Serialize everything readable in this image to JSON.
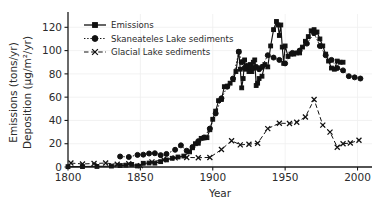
{
  "chart_data": {
    "type": "line",
    "title": "",
    "xlabel": "Year",
    "ylabel_line1": "Emissions (tons/yr)",
    "ylabel_line2": "Deposition (μg/m²/yr)",
    "xlim": [
      1800,
      2010
    ],
    "ylim": [
      0,
      128
    ],
    "xticks": [
      1800,
      1850,
      1900,
      1950,
      2000
    ],
    "yticks": [
      0,
      20,
      40,
      60,
      80,
      100,
      120
    ],
    "grid": true,
    "grid_axis": "y",
    "legend_position": "upper-left",
    "series": [
      {
        "name": "Emissions",
        "marker": "square",
        "linestyle": "solid",
        "color": "#111111",
        "points": [
          [
            1800,
            0.3
          ],
          [
            1810,
            0.4
          ],
          [
            1820,
            0.5
          ],
          [
            1830,
            0.8
          ],
          [
            1836,
            1.2
          ],
          [
            1840,
            1.6
          ],
          [
            1844,
            2.2
          ],
          [
            1848,
            0.9
          ],
          [
            1852,
            3.2
          ],
          [
            1856,
            3.4
          ],
          [
            1860,
            3.3
          ],
          [
            1864,
            4.6
          ],
          [
            1868,
            6.1
          ],
          [
            1872,
            7.5
          ],
          [
            1876,
            8.6
          ],
          [
            1880,
            9.4
          ],
          [
            1884,
            13.0
          ],
          [
            1886,
            16.5
          ],
          [
            1888,
            20.0
          ],
          [
            1890,
            20.4
          ],
          [
            1892,
            24.6
          ],
          [
            1894,
            25.0
          ],
          [
            1896,
            25.2
          ],
          [
            1898,
            32.0
          ],
          [
            1900,
            41.0
          ],
          [
            1902,
            48.0
          ],
          [
            1904,
            57.0
          ],
          [
            1906,
            58.0
          ],
          [
            1908,
            69.0
          ],
          [
            1910,
            69.5
          ],
          [
            1912,
            72.0
          ],
          [
            1914,
            75.0
          ],
          [
            1916,
            82.0
          ],
          [
            1918,
            99.0
          ],
          [
            1919,
            84.0
          ],
          [
            1920,
            68.0
          ],
          [
            1921,
            76.0
          ],
          [
            1922,
            92.0
          ],
          [
            1923,
            84.0
          ],
          [
            1924,
            86.0
          ],
          [
            1925,
            82.0
          ],
          [
            1926,
            88.0
          ],
          [
            1927,
            82.0
          ],
          [
            1928,
            90.0
          ],
          [
            1929,
            92.0
          ],
          [
            1930,
            70.0
          ],
          [
            1931,
            72.0
          ],
          [
            1932,
            76.0
          ],
          [
            1934,
            78.0
          ],
          [
            1936,
            88.0
          ],
          [
            1938,
            86.0
          ],
          [
            1940,
            104.0
          ],
          [
            1942,
            118.0
          ],
          [
            1944,
            125.0
          ],
          [
            1945,
            122.0
          ],
          [
            1946,
            113.0
          ],
          [
            1947,
            122.0
          ],
          [
            1948,
            103.0
          ],
          [
            1949,
            89.0
          ],
          [
            1950,
            104.0
          ],
          [
            1952,
            95.0
          ],
          [
            1954,
            97.0
          ],
          [
            1956,
            97.0
          ],
          [
            1958,
            98.0
          ],
          [
            1960,
            98.0
          ],
          [
            1962,
            103.0
          ],
          [
            1964,
            108.0
          ],
          [
            1966,
            112.0
          ],
          [
            1968,
            117.0
          ],
          [
            1970,
            118.0
          ],
          [
            1972,
            116.0
          ],
          [
            1974,
            110.0
          ],
          [
            1976,
            104.0
          ],
          [
            1978,
            97.0
          ],
          [
            1980,
            91.0
          ],
          [
            1982,
            85.0
          ],
          [
            1984,
            84.0
          ],
          [
            1986,
            91.0
          ],
          [
            1988,
            90.0
          ],
          [
            1990,
            90.0
          ]
        ]
      },
      {
        "name": "Skaneateles Lake sediments",
        "marker": "circle",
        "linestyle": "dotted",
        "color": "#111111",
        "points": [
          [
            1836,
            9.0
          ],
          [
            1842,
            8.6
          ],
          [
            1848,
            10.4
          ],
          [
            1852,
            10.6
          ],
          [
            1856,
            11.6
          ],
          [
            1860,
            11.8
          ],
          [
            1864,
            10.2
          ],
          [
            1868,
            11.2
          ],
          [
            1874,
            14.8
          ],
          [
            1878,
            18.6
          ],
          [
            1882,
            14.0
          ],
          [
            1886,
            17.2
          ],
          [
            1890,
            22.2
          ],
          [
            1894,
            25.4
          ],
          [
            1898,
            33.0
          ],
          [
            1902,
            46.0
          ],
          [
            1906,
            59.0
          ],
          [
            1910,
            69.0
          ],
          [
            1914,
            76.0
          ],
          [
            1918,
            99.0
          ],
          [
            1920,
            90.0
          ],
          [
            1922,
            85.0
          ],
          [
            1924,
            87.0
          ],
          [
            1926,
            86.0
          ],
          [
            1928,
            85.0
          ],
          [
            1930,
            86.0
          ],
          [
            1932,
            84.0
          ],
          [
            1934,
            86.0
          ],
          [
            1938,
            96.0
          ],
          [
            1942,
            94.0
          ],
          [
            1946,
            92.0
          ],
          [
            1950,
            89.0
          ],
          [
            1955,
            98.0
          ],
          [
            1960,
            100.0
          ],
          [
            1965,
            106.0
          ],
          [
            1970,
            115.0
          ],
          [
            1974,
            104.0
          ],
          [
            1978,
            96.0
          ],
          [
            1982,
            92.0
          ],
          [
            1986,
            85.0
          ],
          [
            1990,
            83.0
          ],
          [
            1994,
            78.0
          ],
          [
            1998,
            77.0
          ],
          [
            2002,
            76.0
          ]
        ]
      },
      {
        "name": "Glacial Lake sediments",
        "marker": "x",
        "linestyle": "dashed",
        "color": "#111111",
        "points": [
          [
            1802,
            3.4
          ],
          [
            1810,
            2.6
          ],
          [
            1818,
            3.0
          ],
          [
            1826,
            3.4
          ],
          [
            1834,
            2.4
          ],
          [
            1842,
            2.8
          ],
          [
            1850,
            1.2
          ],
          [
            1858,
            4.4
          ],
          [
            1866,
            6.4
          ],
          [
            1874,
            7.8
          ],
          [
            1882,
            8.2
          ],
          [
            1890,
            8.0
          ],
          [
            1898,
            8.2
          ],
          [
            1906,
            15.0
          ],
          [
            1913,
            22.6
          ],
          [
            1919,
            19.0
          ],
          [
            1925,
            19.6
          ],
          [
            1931,
            20.4
          ],
          [
            1938,
            33.0
          ],
          [
            1946,
            37.6
          ],
          [
            1953,
            37.4
          ],
          [
            1958,
            38.4
          ],
          [
            1964,
            43.0
          ],
          [
            1970,
            58.0
          ],
          [
            1976,
            36.0
          ],
          [
            1981,
            30.0
          ],
          [
            1986,
            17.0
          ],
          [
            1990,
            20.0
          ],
          [
            1995,
            20.6
          ],
          [
            2001,
            23.0
          ]
        ]
      }
    ]
  }
}
